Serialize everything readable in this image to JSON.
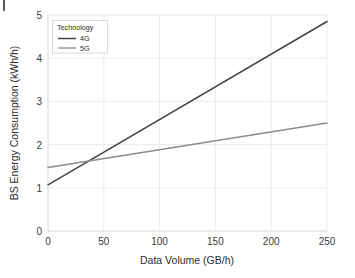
{
  "chart_data": {
    "type": "line",
    "title": "",
    "xlabel": "Data Volume (GB/h)",
    "ylabel": "BS Energy Consumption (kWh/h)",
    "xlim": [
      0,
      250
    ],
    "ylim": [
      0,
      5
    ],
    "xticks": [
      0,
      50,
      100,
      150,
      200,
      250
    ],
    "yticks": [
      0,
      1,
      2,
      3,
      4,
      5
    ],
    "xtick_labels": [
      "0",
      "50",
      "100",
      "150",
      "200",
      "250"
    ],
    "ytick_labels": [
      "0",
      "1",
      "2",
      "3",
      "4",
      "5"
    ],
    "grid": true,
    "legend_position": "upper left",
    "legend_title": "Technology",
    "series": [
      {
        "name": "4G",
        "color": "#444444",
        "x": [
          0,
          250
        ],
        "values": [
          1.07,
          4.85
        ]
      },
      {
        "name": "5G",
        "color": "#8c8c8c",
        "x": [
          0,
          250
        ],
        "values": [
          1.47,
          2.5
        ]
      }
    ],
    "annotations": []
  },
  "colors": {
    "background": "#ffffff",
    "grid": "#ececec",
    "spine": "#d9d9d9",
    "text": "#2b2b2b",
    "series_4g": "#444444",
    "series_5g": "#8c8c8c"
  }
}
